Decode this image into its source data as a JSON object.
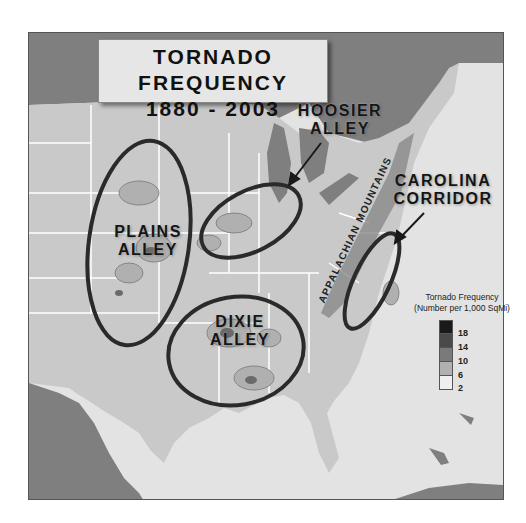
{
  "title": {
    "line1": "TORNADO FREQUENCY",
    "line2": "1880 - 2003"
  },
  "regions": [
    {
      "id": "plains",
      "line1": "PLAINS",
      "line2": "ALLEY"
    },
    {
      "id": "hoosier",
      "line1": "HOOSIER",
      "line2": "ALLEY"
    },
    {
      "id": "dixie",
      "line1": "DIXIE",
      "line2": "ALLEY"
    },
    {
      "id": "carolina",
      "line1": "CAROLINA",
      "line2": "CORRIDOR"
    }
  ],
  "mountains_label": "APPALACHIAN MOUNTAINS",
  "legend": {
    "title": "Tornado Frequency",
    "subtitle": "(Number per 1,000 SqMi)",
    "ticks": [
      "18",
      "14",
      "10",
      "6",
      "2"
    ],
    "colors": [
      "#1a1a1a",
      "#4a4a4a",
      "#7a7a7a",
      "#b0b0b0",
      "#efefef"
    ]
  },
  "colors": {
    "water": "#7f7f7f",
    "land": "#c9c9c9",
    "ocean": "#e3e3e3",
    "ellipse": "#2a2a2a"
  }
}
